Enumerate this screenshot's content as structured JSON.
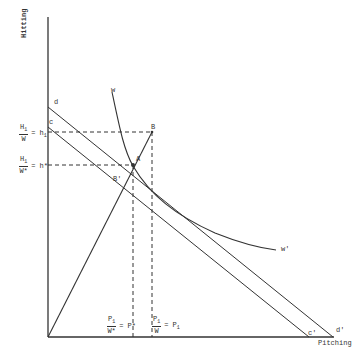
{
  "axes": {
    "y_label": "Hitting",
    "x_label": "Pitching"
  },
  "points": {
    "d": "d",
    "c": "c",
    "B": "B",
    "A": "A",
    "B_prime": "B'",
    "w": "w",
    "w_prime": "w'",
    "c_prime": "c'",
    "d_prime": "d'"
  },
  "y_ticks": {
    "h1": {
      "num": "H",
      "num_sub": "1",
      "den": "W",
      "rhs": "= h",
      "rhs_sub": "1"
    },
    "hstar": {
      "num": "H",
      "num_sub": "1",
      "den": "W*",
      "rhs": "= h*",
      "rhs_sub": ""
    }
  },
  "x_ticks": {
    "pstar": {
      "num": "P",
      "num_sub": "1",
      "den": "W*",
      "rhs": "= P*"
    },
    "p1": {
      "num": "P",
      "num_sub": "1",
      "den": "W",
      "rhs": "= P",
      "rhs_sub": "1"
    }
  },
  "colors": {
    "line": "#333333",
    "background": "#ffffff"
  }
}
